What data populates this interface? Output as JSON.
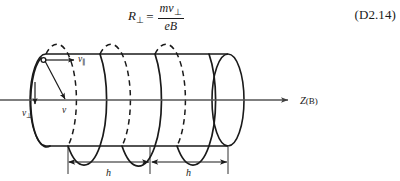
{
  "equation": {
    "lhs_var": "R",
    "lhs_sub": "⊥",
    "relation": "=",
    "numerator_var": "mv",
    "numerator_sub": "⊥",
    "denominator": "eB",
    "number": "(D2.14)",
    "plain_text": "R⊥ = mv⊥ / eB"
  },
  "figure": {
    "caption_axis_label": "Z(B)",
    "axis_label_symbol": "Z",
    "axis_label_field": "(B)",
    "velocity_parallel": {
      "symbol": "v",
      "subscript": "∥",
      "plain": "v∥"
    },
    "velocity_perpendicular": {
      "symbol": "v",
      "subscript": "⊥",
      "plain": "v⊥"
    },
    "velocity_total": {
      "symbol": "v",
      "subscript": "",
      "plain": "v"
    },
    "pitch_label_left": "h",
    "pitch_label_right": "h",
    "start_point_marker": "open-circle",
    "colors": {
      "stroke": "#1a1a1a",
      "axis": "#555555",
      "background": "#ffffff",
      "dash": "#1a1a1a"
    }
  }
}
